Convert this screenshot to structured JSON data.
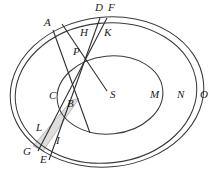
{
  "figure": {
    "background_color": "#ffffff",
    "stroke_color": "#3a3a3a",
    "label_color": "#1b1b1b",
    "shade_color": "#dedede",
    "shade_stroke": "#8c8c8c",
    "width": 218,
    "height": 178
  },
  "labels": {
    "A": "A",
    "B": "B",
    "C": "C",
    "D": "D",
    "E": "E",
    "F": "F",
    "G": "G",
    "H": "H",
    "I": "I",
    "K": "K",
    "L": "L",
    "M": "M",
    "N": "N",
    "O": "O",
    "P": "P",
    "S": "S"
  },
  "label_positions": {
    "A": {
      "x": 44,
      "y": 23
    },
    "B": {
      "x": 68,
      "y": 104
    },
    "C": {
      "x": 50,
      "y": 97
    },
    "D": {
      "x": 95,
      "y": 8
    },
    "E": {
      "x": 41,
      "y": 160
    },
    "F": {
      "x": 107,
      "y": 8
    },
    "G": {
      "x": 24,
      "y": 152
    },
    "H": {
      "x": 81,
      "y": 33
    },
    "I": {
      "x": 57,
      "y": 141
    },
    "K": {
      "x": 104,
      "y": 33
    },
    "L": {
      "x": 37,
      "y": 128
    },
    "M": {
      "x": 151,
      "y": 95
    },
    "N": {
      "x": 178,
      "y": 95
    },
    "O": {
      "x": 200,
      "y": 95
    },
    "P": {
      "x": 74,
      "y": 53
    },
    "S": {
      "x": 111,
      "y": 94
    }
  },
  "geometry": {
    "ellipse_outer": {
      "cx": 107,
      "cy": 92,
      "rx": 97,
      "ry": 75,
      "rotation": -6
    },
    "ellipse_middle": {
      "cx": 106,
      "cy": 93,
      "rx": 91,
      "ry": 70,
      "rotation": -6
    },
    "ellipse_inner": {
      "cx": 110,
      "cy": 95,
      "rx": 53,
      "ry": 39,
      "rotation": -6
    },
    "center_point": {
      "x": 104,
      "y": 90
    },
    "intersection_P": {
      "x": 79,
      "y": 69
    },
    "line_A_to_B": {
      "x1": 53,
      "y1": 30,
      "x2": 89,
      "y2": 131
    },
    "line_S_to_top": {
      "x1": 107,
      "y1": 91,
      "x2": 63,
      "y2": 25
    },
    "band_line_D_E": {
      "x1": 99,
      "y1": 18,
      "x2": 49,
      "y2": 158
    },
    "band_line_F_G": {
      "x1": 106,
      "y1": 18,
      "x2": 37,
      "y2": 150
    }
  },
  "elements": {
    "shaded_band_name": "shaded-band-region",
    "curve_count": 3,
    "ray_count": 2,
    "band_line_count": 2
  }
}
